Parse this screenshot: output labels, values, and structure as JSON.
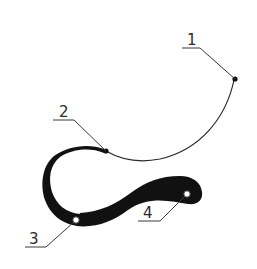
{
  "diagram": {
    "type": "technical-callout-drawing",
    "stroke_color": "#111111",
    "background": "#ffffff",
    "callouts": [
      {
        "number": "1",
        "marker": "filled-dot",
        "label": "1"
      },
      {
        "number": "2",
        "marker": "filled-dot",
        "label": "2"
      },
      {
        "number": "3",
        "marker": "hollow-circle",
        "label": "3"
      },
      {
        "number": "4",
        "marker": "hollow-circle",
        "label": "4"
      }
    ]
  }
}
